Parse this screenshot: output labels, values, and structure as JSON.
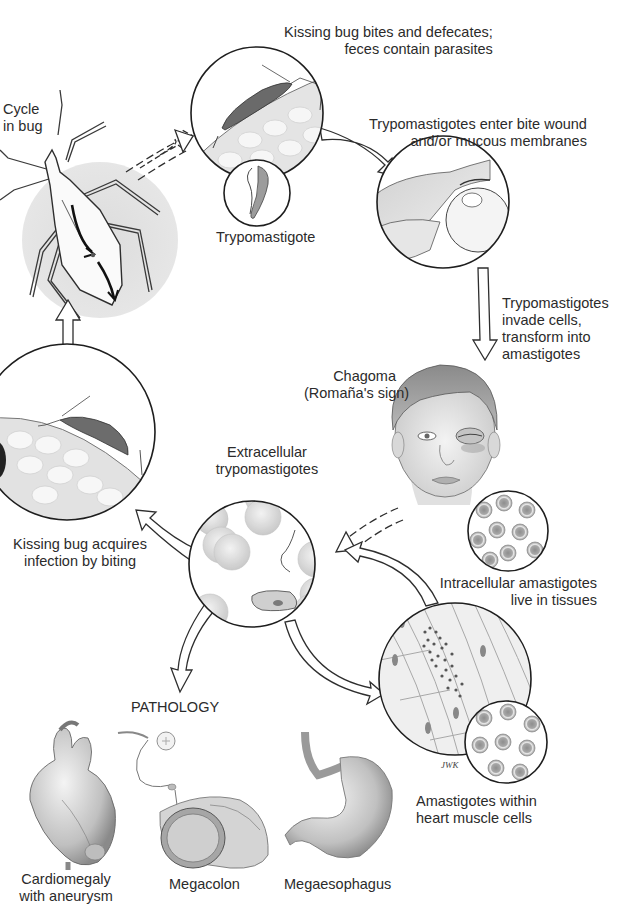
{
  "diagram": {
    "colors": {
      "ink": "#1e1e1e",
      "shade_light": "#d9d9d9",
      "shade_mid": "#b5b5b5",
      "shade_dark": "#7a7a7a",
      "background": "#ffffff"
    },
    "labels": {
      "cycle_in_bug": [
        "Cycle",
        "in bug"
      ],
      "bites_defecates": [
        "Kissing bug bites and defecates;",
        "feces contain parasites"
      ],
      "trypomastigote": "Trypomastigote",
      "enter_wound": [
        "Trypomastigotes enter bite wound",
        "and/or mucous membranes"
      ],
      "invade_cells": [
        "Trypomastigotes",
        "invade cells,",
        "transform into",
        "amastigotes"
      ],
      "chagoma": [
        "Chagoma",
        "(Romaña's sign)"
      ],
      "extracellular": [
        "Extracellular",
        "trypomastigotes"
      ],
      "acquires_infection": [
        "Kissing bug acquires",
        "infection by biting"
      ],
      "intracellular": [
        "Intracellular amastigotes",
        "live in tissues"
      ],
      "pathology": "PATHOLOGY",
      "heart_muscle": [
        "Amastigotes within",
        "heart muscle cells"
      ],
      "cardiomegaly": [
        "Cardiomegaly",
        "with aneurysm"
      ],
      "megacolon": "Megacolon",
      "megaesophagus": "Megaesophagus",
      "artist_signature": "JWK"
    },
    "nodes": [
      {
        "id": "bug-cycle",
        "label": "Cycle in bug"
      },
      {
        "id": "bite",
        "label": "Kissing bug bites and defecates; feces contain parasites"
      },
      {
        "id": "trypomastigote-inset",
        "label": "Trypomastigote"
      },
      {
        "id": "wound-entry",
        "label": "Trypomastigotes enter bite wound and/or mucous membranes"
      },
      {
        "id": "chagoma",
        "label": "Chagoma (Romaña's sign)"
      },
      {
        "id": "intracellular",
        "label": "Intracellular amastigotes live in tissues"
      },
      {
        "id": "heart-muscle",
        "label": "Amastigotes within heart muscle cells"
      },
      {
        "id": "extracellular",
        "label": "Extracellular trypomastigotes"
      },
      {
        "id": "bug-acquires",
        "label": "Kissing bug acquires infection by biting"
      },
      {
        "id": "pathology",
        "label": "PATHOLOGY"
      }
    ],
    "edges": [
      {
        "from": "bug-cycle",
        "to": "bite"
      },
      {
        "from": "bite",
        "to": "wound-entry"
      },
      {
        "from": "wound-entry",
        "to": "chagoma",
        "label": "Trypomastigotes invade cells, transform into amastigotes"
      },
      {
        "from": "chagoma",
        "to": "extracellular"
      },
      {
        "from": "heart-muscle",
        "to": "extracellular"
      },
      {
        "from": "extracellular",
        "to": "heart-muscle"
      },
      {
        "from": "extracellular",
        "to": "bug-acquires"
      },
      {
        "from": "bug-acquires",
        "to": "bug-cycle"
      },
      {
        "from": "extracellular",
        "to": "pathology"
      }
    ]
  }
}
